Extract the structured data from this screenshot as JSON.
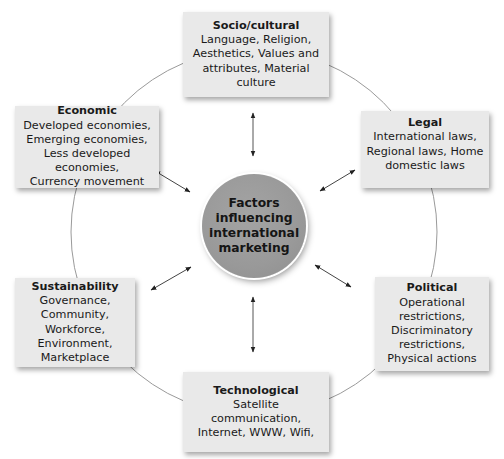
{
  "diagram": {
    "center": {
      "label": "Factors influencing international marketing",
      "lines": [
        "Factors",
        "influencing",
        "international",
        "marketing"
      ]
    },
    "factors": [
      {
        "id": "socio-cultural",
        "title": "Socio/cultural",
        "lines": [
          "Language, Religion,",
          "Aesthetics, Values and",
          "attributes, Material",
          "culture"
        ]
      },
      {
        "id": "legal",
        "title": "Legal",
        "lines": [
          "International laws,",
          "Regional laws, Home",
          "domestic laws"
        ]
      },
      {
        "id": "political",
        "title": "Political",
        "lines": [
          "Operational",
          "restrictions,",
          "Discriminatory",
          "restrictions,",
          "Physical actions"
        ]
      },
      {
        "id": "technological",
        "title": "Technological",
        "lines": [
          "Satellite communication,",
          "Internet, WWW, Wifi,"
        ]
      },
      {
        "id": "sustainability",
        "title": "Sustainability",
        "lines": [
          "Governance,",
          "Community,",
          "Workforce,",
          "Environment,",
          "Marketplace"
        ]
      },
      {
        "id": "economic",
        "title": "Economic",
        "lines": [
          "Developed economies,",
          "Emerging economies,",
          "Less developed",
          "economies,",
          "Currency movement"
        ]
      }
    ],
    "connectors": "double-headed arrows between center and each factor",
    "colors": {
      "box_fill": "#e9e9e9",
      "center_fill": "#9a9a9a",
      "ring_stroke": "#9a9a9a",
      "arrow_stroke": "#222222",
      "background": "#ffffff"
    }
  }
}
